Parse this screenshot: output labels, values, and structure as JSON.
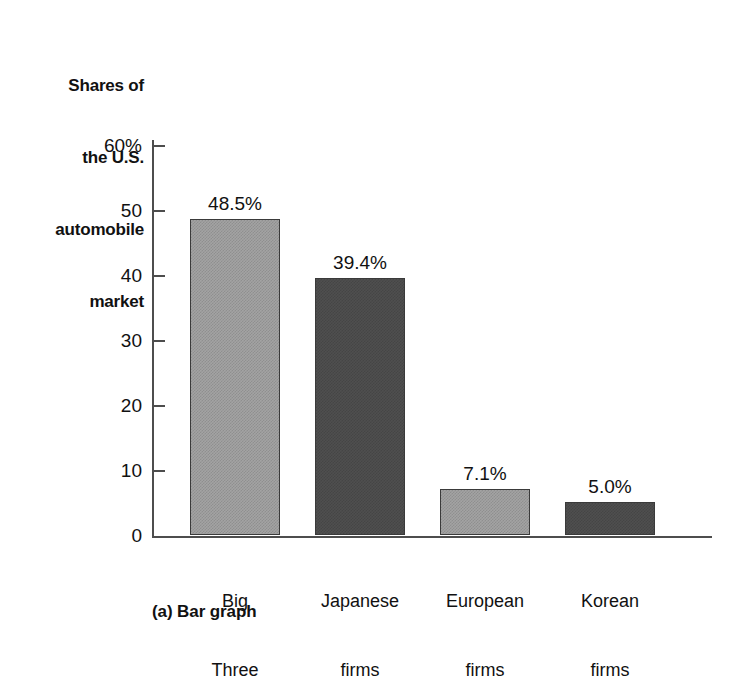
{
  "chart_data": {
    "type": "bar",
    "title": "Shares of the U.S. automobile market",
    "title_lines": [
      "Shares of",
      "the U.S.",
      "automobile",
      "market"
    ],
    "caption": "(a) Bar graph",
    "categories": [
      "Big Three",
      "Japanese firms",
      "European firms",
      "Korean firms"
    ],
    "category_lines": [
      [
        "Big",
        "Three"
      ],
      [
        "Japanese",
        "firms"
      ],
      [
        "European",
        "firms"
      ],
      [
        "Korean",
        "firms"
      ]
    ],
    "values": [
      48.5,
      39.4,
      7.1,
      5.0
    ],
    "value_labels": [
      "48.5%",
      "39.4%",
      "7.1%",
      "5.0%"
    ],
    "bar_styles": [
      "light",
      "dark",
      "light",
      "dark"
    ],
    "xlabel": "",
    "ylabel": "",
    "ylim": [
      0,
      60
    ],
    "ytick_values": [
      60,
      50,
      40,
      30,
      20,
      10,
      0
    ],
    "ytick_labels": [
      "60%",
      "50",
      "40",
      "30",
      "20",
      "10",
      "0"
    ],
    "grid": false,
    "legend": "none",
    "colors": {
      "bar_light": "#a3a3a3",
      "bar_dark": "#4f4f4f",
      "bar_edge": "#3a3a3a",
      "axis": "#4d4d4d",
      "text": "#111111",
      "background": "#ffffff"
    }
  }
}
